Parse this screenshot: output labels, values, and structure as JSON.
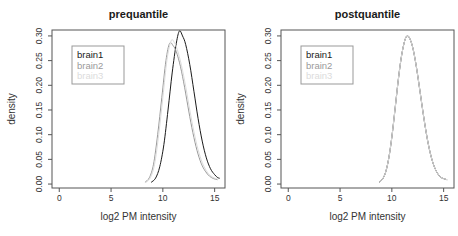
{
  "figure": {
    "background": "#ffffff",
    "axis_color": "#555555",
    "tick_label_color": "#333333"
  },
  "chart_data": [
    {
      "type": "line",
      "title": "prequantile",
      "xlabel": "log2 PM intensity",
      "ylabel": "density",
      "xlim": [
        -0.7,
        16.0
      ],
      "ylim": [
        -0.008,
        0.312
      ],
      "grid": false,
      "xticks": [
        "0",
        "5",
        "10",
        "15"
      ],
      "xtick_values": [
        0,
        5,
        10,
        15
      ],
      "yticks": [
        "0.00",
        "0.05",
        "0.10",
        "0.15",
        "0.20",
        "0.25",
        "0.30"
      ],
      "ytick_values": [
        0.0,
        0.05,
        0.1,
        0.15,
        0.2,
        0.25,
        0.3
      ],
      "legend": {
        "position": "top-left",
        "entries": [
          {
            "label": "brain1",
            "color": "#1a1a1a"
          },
          {
            "label": "brain2",
            "color": "#9a9a9a"
          },
          {
            "label": "brain3",
            "color": "#dcdcdc"
          }
        ]
      },
      "series": [
        {
          "name": "brain1",
          "color": "#1a1a1a",
          "x": [
            8.9,
            9.3,
            9.7,
            10.1,
            10.5,
            10.9,
            11.3,
            11.6,
            11.9,
            12.2,
            12.6,
            13.0,
            13.4,
            13.8,
            14.2,
            14.6,
            15.0,
            15.3,
            15.45
          ],
          "y": [
            0.004,
            0.012,
            0.035,
            0.08,
            0.15,
            0.225,
            0.285,
            0.31,
            0.3,
            0.283,
            0.242,
            0.188,
            0.133,
            0.087,
            0.053,
            0.031,
            0.019,
            0.013,
            0.012
          ]
        },
        {
          "name": "brain2",
          "color": "#9a9a9a",
          "x": [
            8.3,
            8.7,
            9.1,
            9.5,
            9.9,
            10.3,
            10.65,
            11.0,
            11.3,
            11.7,
            12.1,
            12.5,
            12.9,
            13.3,
            13.7,
            14.1,
            14.5,
            14.9,
            15.25
          ],
          "y": [
            0.004,
            0.013,
            0.04,
            0.1,
            0.175,
            0.25,
            0.285,
            0.28,
            0.268,
            0.238,
            0.196,
            0.148,
            0.104,
            0.068,
            0.042,
            0.026,
            0.016,
            0.011,
            0.009
          ]
        },
        {
          "name": "brain3",
          "color": "#dcdcdc",
          "x": [
            8.4,
            8.8,
            9.2,
            9.6,
            10.0,
            10.4,
            10.8,
            11.1,
            11.4,
            11.8,
            12.2,
            12.6,
            13.0,
            13.4,
            13.8,
            14.2,
            14.6,
            15.0,
            15.3
          ],
          "y": [
            0.004,
            0.013,
            0.04,
            0.1,
            0.175,
            0.252,
            0.29,
            0.287,
            0.272,
            0.24,
            0.198,
            0.15,
            0.106,
            0.07,
            0.044,
            0.027,
            0.017,
            0.012,
            0.01
          ]
        }
      ]
    },
    {
      "type": "line",
      "title": "postquantile",
      "xlabel": "log2 PM intensity",
      "ylabel": "density",
      "xlim": [
        -0.7,
        16.0
      ],
      "ylim": [
        -0.008,
        0.312
      ],
      "grid": false,
      "xticks": [
        "0",
        "5",
        "10",
        "15"
      ],
      "xtick_values": [
        0,
        5,
        10,
        15
      ],
      "yticks": [
        "0.00",
        "0.05",
        "0.10",
        "0.15",
        "0.20",
        "0.25",
        "0.30"
      ],
      "ytick_values": [
        0.0,
        0.05,
        0.1,
        0.15,
        0.2,
        0.25,
        0.3
      ],
      "legend": {
        "position": "top-left",
        "entries": [
          {
            "label": "brain1",
            "color": "#1a1a1a"
          },
          {
            "label": "brain2",
            "color": "#9a9a9a"
          },
          {
            "label": "brain3",
            "color": "#dcdcdc"
          }
        ]
      },
      "series": [
        {
          "name": "brain1",
          "color": "#1a1a1a",
          "x": [
            8.8,
            9.1,
            9.4,
            9.7,
            10.0,
            10.3,
            10.6,
            10.9,
            11.2,
            11.45,
            11.7,
            12.0,
            12.3,
            12.6,
            12.9,
            13.2,
            13.5,
            13.8,
            14.1,
            14.4,
            14.7,
            15.0,
            15.3
          ],
          "y": [
            0.004,
            0.01,
            0.024,
            0.052,
            0.095,
            0.15,
            0.207,
            0.255,
            0.287,
            0.3,
            0.296,
            0.278,
            0.246,
            0.205,
            0.161,
            0.119,
            0.083,
            0.055,
            0.035,
            0.022,
            0.014,
            0.011,
            0.009
          ]
        },
        {
          "name": "brain2",
          "color": "#9a9a9a",
          "x": [
            8.8,
            9.1,
            9.4,
            9.7,
            10.0,
            10.3,
            10.6,
            10.9,
            11.2,
            11.45,
            11.7,
            12.0,
            12.3,
            12.6,
            12.9,
            13.2,
            13.5,
            13.8,
            14.1,
            14.4,
            14.7,
            15.0,
            15.3
          ],
          "y": [
            0.004,
            0.01,
            0.024,
            0.052,
            0.095,
            0.15,
            0.207,
            0.255,
            0.287,
            0.3,
            0.296,
            0.278,
            0.246,
            0.205,
            0.161,
            0.119,
            0.083,
            0.055,
            0.035,
            0.022,
            0.014,
            0.011,
            0.009
          ]
        },
        {
          "name": "brain3",
          "color": "#dcdcdc",
          "x": [
            8.8,
            9.1,
            9.4,
            9.7,
            10.0,
            10.3,
            10.6,
            10.9,
            11.2,
            11.45,
            11.7,
            12.0,
            12.3,
            12.6,
            12.9,
            13.2,
            13.5,
            13.8,
            14.1,
            14.4,
            14.7,
            15.0,
            15.3
          ],
          "y": [
            0.004,
            0.01,
            0.024,
            0.052,
            0.095,
            0.15,
            0.207,
            0.255,
            0.287,
            0.3,
            0.296,
            0.278,
            0.246,
            0.205,
            0.161,
            0.119,
            0.083,
            0.055,
            0.035,
            0.022,
            0.014,
            0.011,
            0.009
          ]
        }
      ]
    }
  ]
}
